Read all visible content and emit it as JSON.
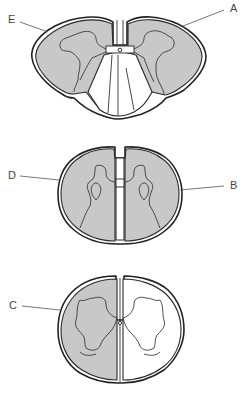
{
  "figure": {
    "colors": {
      "shaded": "#c8c8c8",
      "outline": "#222222",
      "background": "#ffffff",
      "label": "#444444"
    },
    "sections": [
      {
        "id": "top",
        "shaded_regions": [
          "left-lateral-posterior",
          "right-lateral-posterior"
        ],
        "unshaded_regions": [
          "anterior-central"
        ],
        "labels": [
          "E",
          "A"
        ]
      },
      {
        "id": "middle",
        "shaded_regions": [
          "left-hemicord",
          "right-hemicord"
        ],
        "unshaded_regions": [],
        "labels": [
          "D",
          "B"
        ]
      },
      {
        "id": "bottom",
        "shaded_regions": [
          "left-hemicord"
        ],
        "unshaded_regions": [
          "right-hemicord"
        ],
        "labels": [
          "C"
        ]
      }
    ],
    "labels": {
      "A": "A",
      "B": "B",
      "C": "C",
      "D": "D",
      "E": "E"
    }
  }
}
